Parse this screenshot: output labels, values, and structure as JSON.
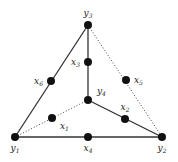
{
  "diagram": {
    "type": "graph",
    "nodes": [
      {
        "id": "y1",
        "base": "y",
        "sub": "1",
        "pos": [
          15,
          137
        ],
        "label_anchor": "below"
      },
      {
        "id": "y2",
        "base": "y",
        "sub": "2",
        "pos": [
          162,
          137
        ],
        "label_anchor": "below"
      },
      {
        "id": "y3",
        "base": "y",
        "sub": "3",
        "pos": [
          88,
          25
        ],
        "label_anchor": "above"
      },
      {
        "id": "y4",
        "base": "y",
        "sub": "4",
        "pos": [
          88,
          100
        ],
        "label_anchor": "upper-right"
      },
      {
        "id": "x1",
        "base": "x",
        "sub": "1",
        "pos": [
          52,
          118
        ],
        "label_anchor": "lower-right"
      },
      {
        "id": "x2",
        "base": "x",
        "sub": "2",
        "pos": [
          125,
          119
        ],
        "label_anchor": "above"
      },
      {
        "id": "x3",
        "base": "x",
        "sub": "3",
        "pos": [
          88,
          62
        ],
        "label_anchor": "left"
      },
      {
        "id": "x4",
        "base": "x",
        "sub": "4",
        "pos": [
          88,
          137
        ],
        "label_anchor": "below"
      },
      {
        "id": "x5",
        "base": "x",
        "sub": "5",
        "pos": [
          126,
          80
        ],
        "label_anchor": "right"
      },
      {
        "id": "x6",
        "base": "x",
        "sub": "6",
        "pos": [
          51,
          81
        ],
        "label_anchor": "left"
      }
    ],
    "edges": [
      {
        "from": "y1",
        "to": "y3",
        "style": "solid"
      },
      {
        "from": "y3",
        "to": "y4",
        "style": "solid"
      },
      {
        "from": "y4",
        "to": "y2",
        "style": "solid"
      },
      {
        "from": "y1",
        "to": "y2",
        "style": "solid"
      },
      {
        "from": "y1",
        "to": "y4",
        "style": "dotted"
      },
      {
        "from": "y3",
        "to": "y2",
        "style": "dotted"
      }
    ]
  }
}
